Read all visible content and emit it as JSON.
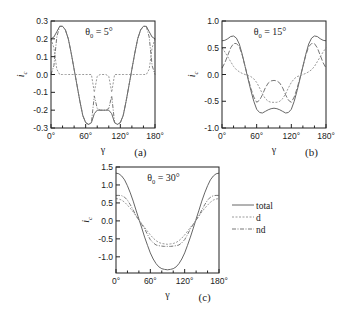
{
  "chart_data": [
    {
      "id": "a",
      "type": "line",
      "panel_label": "(a)",
      "annotation": "θ₀ = 5°",
      "annotation_main": "θ",
      "annotation_sub": "0",
      "annotation_rest": " = 5°",
      "xlabel": "γ",
      "ylabel": "i",
      "ylabel_sub": "c",
      "xlim": [
        0,
        180
      ],
      "ylim": [
        -0.3,
        0.3
      ],
      "xticks": [
        0,
        60,
        120,
        180
      ],
      "xtick_labels": [
        "0°",
        "60°",
        "120°",
        "180°"
      ],
      "yticks": [
        -0.3,
        -0.2,
        -0.1,
        0.0,
        0.1,
        0.2,
        0.3
      ],
      "ytick_labels": [
        "-0.3",
        "-0.2",
        "-0.1",
        "0.0",
        "0.1",
        "0.2",
        "0.3"
      ],
      "grid": false,
      "frame": {
        "x": 51,
        "y": 21,
        "w": 104,
        "h": 107
      },
      "x": [
        0,
        5,
        10,
        15,
        20,
        25,
        30,
        35,
        40,
        45,
        50,
        55,
        60,
        65,
        70,
        75,
        80,
        85,
        90,
        95,
        100,
        105,
        110,
        115,
        120,
        125,
        130,
        135,
        140,
        145,
        150,
        155,
        160,
        165,
        170,
        175,
        180
      ],
      "series": [
        {
          "name": "total",
          "style": "solid",
          "values": [
            0.2,
            0.21,
            0.24,
            0.27,
            0.27,
            0.25,
            0.2,
            0.12,
            0.03,
            -0.06,
            -0.15,
            -0.23,
            -0.27,
            -0.28,
            -0.27,
            -0.22,
            -0.2,
            -0.2,
            -0.2,
            -0.2,
            -0.2,
            -0.22,
            -0.27,
            -0.28,
            -0.27,
            -0.23,
            -0.15,
            -0.06,
            0.03,
            0.12,
            0.2,
            0.25,
            0.27,
            0.27,
            0.24,
            0.21,
            0.2
          ]
        },
        {
          "name": "d",
          "style": "dotted",
          "values": [
            0.2,
            0.15,
            0.03,
            0.0,
            0.0,
            0.0,
            0.0,
            0.0,
            0.0,
            0.0,
            0.0,
            0.0,
            0.0,
            0.0,
            0.0,
            -0.1,
            -0.01,
            0.0,
            0.0,
            0.0,
            -0.01,
            -0.1,
            0.0,
            0.0,
            0.0,
            0.0,
            0.0,
            0.0,
            0.0,
            0.0,
            0.0,
            0.0,
            0.0,
            0.0,
            0.03,
            0.15,
            0.2
          ]
        },
        {
          "name": "nd",
          "style": "dashdot",
          "values": [
            0.0,
            0.05,
            0.21,
            0.27,
            0.27,
            0.25,
            0.2,
            0.12,
            0.03,
            -0.06,
            -0.15,
            -0.23,
            -0.27,
            -0.28,
            -0.27,
            -0.12,
            -0.19,
            -0.2,
            -0.2,
            -0.2,
            -0.19,
            -0.12,
            -0.27,
            -0.28,
            -0.27,
            -0.23,
            -0.15,
            -0.06,
            0.03,
            0.12,
            0.2,
            0.25,
            0.27,
            0.27,
            0.21,
            0.05,
            0.0
          ]
        }
      ]
    },
    {
      "id": "b",
      "type": "line",
      "panel_label": "(b)",
      "annotation": "θ₀ = 15°",
      "annotation_main": "θ",
      "annotation_sub": "0",
      "annotation_rest": " = 15°",
      "xlabel": "γ",
      "ylabel": "i",
      "ylabel_sub": "c",
      "xlim": [
        0,
        180
      ],
      "ylim": [
        -1.0,
        1.0
      ],
      "xticks": [
        0,
        60,
        120,
        180
      ],
      "xtick_labels": [
        "0°",
        "60°",
        "120°",
        "180°"
      ],
      "yticks": [
        -1.0,
        -0.5,
        0.0,
        0.5,
        1.0
      ],
      "ytick_labels": [
        "-1.0",
        "-0.5",
        "0.0",
        "0.5",
        "1.0"
      ],
      "grid": false,
      "frame": {
        "x": 222,
        "y": 21,
        "w": 104,
        "h": 107
      },
      "x": [
        0,
        5,
        10,
        15,
        20,
        25,
        30,
        35,
        40,
        45,
        50,
        55,
        60,
        65,
        70,
        75,
        80,
        85,
        90,
        95,
        100,
        105,
        110,
        115,
        120,
        125,
        130,
        135,
        140,
        145,
        150,
        155,
        160,
        165,
        170,
        175,
        180
      ],
      "series": [
        {
          "name": "total",
          "style": "solid",
          "values": [
            0.63,
            0.64,
            0.67,
            0.71,
            0.72,
            0.68,
            0.57,
            0.38,
            0.15,
            -0.08,
            -0.3,
            -0.5,
            -0.65,
            -0.71,
            -0.72,
            -0.69,
            -0.66,
            -0.64,
            -0.63,
            -0.64,
            -0.66,
            -0.69,
            -0.72,
            -0.71,
            -0.65,
            -0.5,
            -0.3,
            -0.08,
            0.15,
            0.38,
            0.57,
            0.68,
            0.72,
            0.71,
            0.67,
            0.64,
            0.63
          ]
        },
        {
          "name": "d",
          "style": "dotted",
          "values": [
            0.5,
            0.42,
            0.33,
            0.24,
            0.15,
            0.09,
            0.05,
            0.02,
            0.0,
            -0.02,
            -0.04,
            -0.08,
            -0.15,
            -0.25,
            -0.36,
            -0.45,
            -0.5,
            -0.52,
            -0.52,
            -0.52,
            -0.5,
            -0.45,
            -0.36,
            -0.25,
            -0.15,
            -0.08,
            -0.04,
            -0.02,
            0.0,
            0.02,
            0.05,
            0.09,
            0.15,
            0.24,
            0.33,
            0.42,
            0.5
          ]
        },
        {
          "name": "nd",
          "style": "dashdash",
          "values": [
            0.12,
            0.22,
            0.36,
            0.5,
            0.58,
            0.58,
            0.52,
            0.36,
            0.15,
            -0.06,
            -0.26,
            -0.42,
            -0.52,
            -0.48,
            -0.38,
            -0.25,
            -0.16,
            -0.12,
            -0.11,
            -0.12,
            -0.16,
            -0.25,
            -0.38,
            -0.48,
            -0.52,
            -0.42,
            -0.26,
            -0.06,
            0.15,
            0.36,
            0.52,
            0.58,
            0.58,
            0.5,
            0.36,
            0.22,
            0.12
          ]
        }
      ]
    },
    {
      "id": "c",
      "type": "line",
      "panel_label": "(c)",
      "annotation": "θ₀ = 30°",
      "annotation_main": "θ",
      "annotation_sub": "0",
      "annotation_rest": " = 30°",
      "xlabel": "γ",
      "ylabel": "i",
      "ylabel_sub": "c",
      "xlim": [
        0,
        180
      ],
      "ylim": [
        -1.45,
        1.5
      ],
      "xticks": [
        0,
        60,
        120,
        180
      ],
      "xtick_labels": [
        "0°",
        "60°",
        "120°",
        "180°"
      ],
      "yticks": [
        -1.0,
        -0.5,
        0.0,
        0.5,
        1.0,
        1.5
      ],
      "ytick_labels": [
        "-1.0",
        "-0.5",
        "0.0",
        "0.5",
        "1.0",
        "1.5"
      ],
      "grid": false,
      "frame": {
        "x": 116,
        "y": 167,
        "w": 103,
        "h": 106
      },
      "x": [
        0,
        5,
        10,
        15,
        20,
        25,
        30,
        35,
        40,
        45,
        50,
        55,
        60,
        65,
        70,
        75,
        80,
        85,
        90,
        95,
        100,
        105,
        110,
        115,
        120,
        125,
        130,
        135,
        140,
        145,
        150,
        155,
        160,
        165,
        170,
        175,
        180
      ],
      "series": [
        {
          "name": "total",
          "style": "solid",
          "values": [
            1.33,
            1.31,
            1.25,
            1.14,
            0.98,
            0.78,
            0.55,
            0.3,
            0.05,
            -0.2,
            -0.45,
            -0.68,
            -0.89,
            -1.06,
            -1.19,
            -1.28,
            -1.33,
            -1.35,
            -1.36,
            -1.35,
            -1.33,
            -1.28,
            -1.19,
            -1.06,
            -0.89,
            -0.68,
            -0.45,
            -0.2,
            0.05,
            0.3,
            0.55,
            0.78,
            0.98,
            1.14,
            1.25,
            1.31,
            1.33
          ]
        },
        {
          "name": "d",
          "style": "dotted",
          "values": [
            0.62,
            0.61,
            0.58,
            0.52,
            0.44,
            0.35,
            0.25,
            0.14,
            0.03,
            -0.08,
            -0.18,
            -0.29,
            -0.39,
            -0.48,
            -0.55,
            -0.6,
            -0.63,
            -0.64,
            -0.65,
            -0.64,
            -0.63,
            -0.6,
            -0.55,
            -0.48,
            -0.39,
            -0.29,
            -0.18,
            -0.08,
            0.03,
            0.14,
            0.25,
            0.35,
            0.44,
            0.52,
            0.58,
            0.61,
            0.62
          ]
        },
        {
          "name": "nd",
          "style": "dashdot",
          "values": [
            0.71,
            0.71,
            0.7,
            0.66,
            0.58,
            0.45,
            0.3,
            0.15,
            0.02,
            -0.1,
            -0.22,
            -0.38,
            -0.52,
            -0.61,
            -0.67,
            -0.69,
            -0.7,
            -0.71,
            -0.71,
            -0.71,
            -0.7,
            -0.69,
            -0.67,
            -0.61,
            -0.52,
            -0.38,
            -0.22,
            -0.1,
            0.02,
            0.15,
            0.3,
            0.45,
            0.58,
            0.66,
            0.7,
            0.71,
            0.71
          ]
        }
      ]
    }
  ],
  "legend": {
    "position": "right of panel (c)",
    "entries": [
      {
        "label": "total",
        "style": "solid"
      },
      {
        "label": "d",
        "style": "dotted"
      },
      {
        "label": "nd",
        "style": "dashdot"
      }
    ]
  },
  "styles": {
    "solid": {
      "color": "#666666",
      "dash": ""
    },
    "dotted": {
      "color": "#9a9a9a",
      "dash": "2,1.5"
    },
    "dashdot": {
      "color": "#777777",
      "dash": "4,1.5,1,1.5"
    },
    "dashdash": {
      "color": "#777777",
      "dash": "5,2"
    }
  }
}
